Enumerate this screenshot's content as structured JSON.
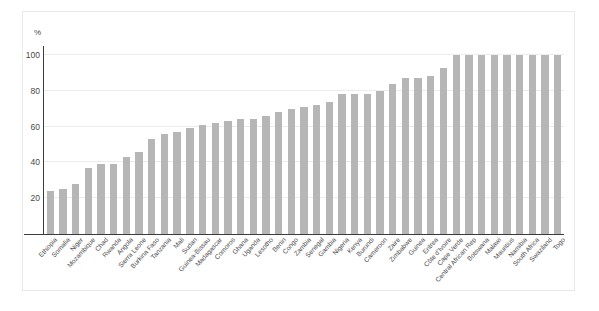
{
  "chart_data": {
    "type": "bar",
    "title": "",
    "subtitle": "",
    "xlabel": "",
    "ylabel": "%",
    "unit_label": "%",
    "ylim": [
      0,
      105
    ],
    "ytick_labels": [
      "100",
      "80",
      "60",
      "40",
      "20"
    ],
    "yticks": [
      100,
      80,
      60,
      40,
      20
    ],
    "grid": true,
    "legend": "none",
    "bar_color": "#b6b6b6",
    "categories": [
      "Ethiopia",
      "Somalia",
      "Niger",
      "Mozambique",
      "Chad",
      "Rwanda",
      "Angola",
      "Sierra Leone",
      "Burkina Faso",
      "Tanzania",
      "Mali",
      "Sudan",
      "Guinea-Bissau",
      "Madagascar",
      "Comoros",
      "Ghana",
      "Uganda",
      "Lesotho",
      "Benin",
      "Congo",
      "Zambia",
      "Senegal",
      "Gambia",
      "Nigeria",
      "Kenya",
      "Burundi",
      "Cameroon",
      "Zaire",
      "Zimbabwe",
      "Guinea",
      "Eritrea",
      "Côte d'Ivoire",
      "Cape Verde",
      "Central African Rep",
      "Botswana",
      "Malawi",
      "Mauritius",
      "Namibia",
      "South Africa",
      "Swaziland",
      "Togo"
    ],
    "values": [
      24,
      25,
      28,
      37,
      39,
      39,
      43,
      46,
      53,
      56,
      57,
      59,
      61,
      62,
      63,
      64,
      64,
      66,
      68,
      70,
      71,
      72,
      74,
      78,
      78,
      78,
      80,
      84,
      87,
      87,
      88,
      93,
      100,
      100,
      100,
      100,
      100,
      100,
      100,
      100,
      100
    ]
  }
}
